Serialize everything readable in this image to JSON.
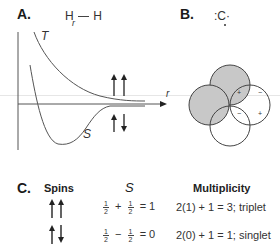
{
  "panels": {
    "A": {
      "label": "A.",
      "molecule": {
        "left": "H",
        "bond_label": "r",
        "right": "H"
      },
      "curves": [
        {
          "name": "T",
          "label": "T",
          "description": "triplet repulsive curve"
        },
        {
          "name": "S",
          "label": "S",
          "description": "singlet bonding curve with minimum"
        }
      ],
      "axis_label": "r",
      "spin_icons": {
        "triplet": "up-up-arrows",
        "singlet": "up-down-arrows"
      }
    },
    "B": {
      "label": "B.",
      "species": ":C·",
      "orbital_signs": {
        "top_left": "+",
        "top_right": "−",
        "bottom_left": "−",
        "bottom_right": "+"
      },
      "shaded_color": "#c8c8c8"
    },
    "C": {
      "label": "C.",
      "headers": {
        "spins": "Spins",
        "s": "S",
        "multiplicity": "Multiplicity"
      },
      "rows": [
        {
          "spins": "up-up",
          "s_a": {
            "num": "1",
            "den": "2"
          },
          "op": "+",
          "s_b": {
            "num": "1",
            "den": "2"
          },
          "s_result": "= 1",
          "multiplicity": "2(1) + 1 = 3; triplet"
        },
        {
          "spins": "up-down",
          "s_a": {
            "num": "1",
            "den": "2"
          },
          "op": "−",
          "s_b": {
            "num": "1",
            "den": "2"
          },
          "s_result": "= 0",
          "multiplicity": "2(0) + 1 = 1; singlet"
        }
      ]
    }
  }
}
